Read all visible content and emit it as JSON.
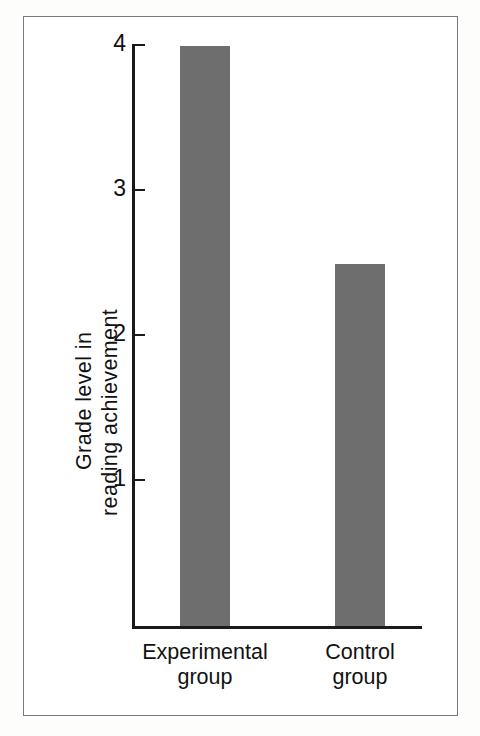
{
  "figure": {
    "background_color": "#ffffff",
    "frame_color": "#7a7a7a",
    "axis_color": "#1a1a1a",
    "bar_color": "#6e6e6e"
  },
  "chart_data": {
    "type": "bar",
    "title": "",
    "subtitle": "",
    "xlabel": "",
    "ylabel": "Grade level in reading achievement",
    "ylabel_lines": [
      "Grade level in",
      "reading achievement"
    ],
    "categories": [
      "Experimental group",
      "Control group"
    ],
    "category_lines": [
      [
        "Experimental",
        "group"
      ],
      [
        "Control",
        "group"
      ]
    ],
    "values": [
      4.0,
      2.5
    ],
    "ylim": [
      0,
      4.3
    ],
    "yticks": [
      1,
      2,
      3,
      4
    ],
    "ytick_labels": [
      "1",
      "2",
      "3",
      "4"
    ],
    "grid": false,
    "legend": null,
    "legend_position": "none",
    "bar_color": "#6e6e6e",
    "annotations": []
  }
}
